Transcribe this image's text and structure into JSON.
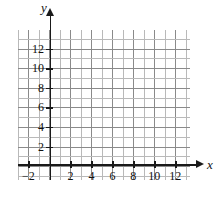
{
  "chart_data": {
    "type": "scatter",
    "title": "",
    "xlabel": "x",
    "ylabel": "y",
    "xlim": [
      -3,
      13.4
    ],
    "ylim": [
      -1.4,
      13.9
    ],
    "grid": true,
    "legend": null,
    "series": [],
    "x_ticks": [
      {
        "value": -2,
        "label": "−2"
      },
      {
        "value": 2,
        "label": "2"
      },
      {
        "value": 4,
        "label": "4"
      },
      {
        "value": 6,
        "label": "6"
      },
      {
        "value": 8,
        "label": "8"
      },
      {
        "value": 10,
        "label": "10"
      },
      {
        "value": 12,
        "label": "12"
      }
    ],
    "y_ticks": [
      {
        "value": 2,
        "label": "2"
      },
      {
        "value": 4,
        "label": "4"
      },
      {
        "value": 6,
        "label": "6"
      },
      {
        "value": 8,
        "label": "8"
      },
      {
        "value": 10,
        "label": "10"
      },
      {
        "value": 12,
        "label": "12"
      }
    ],
    "minor_gridline_step": 1,
    "major_gridline_step": 2
  },
  "axes": {
    "x_name": "x",
    "y_name": "y"
  },
  "colors": {
    "axis": "#1a1a1a",
    "gridline_major": "#8a8a8a",
    "gridline_minor": "#b9b9b9",
    "background": "#ffffff",
    "text": "#111111"
  }
}
